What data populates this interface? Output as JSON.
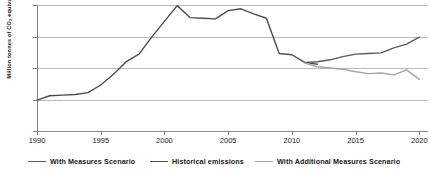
{
  "chart_data": {
    "type": "line",
    "title": "",
    "xlabel": "",
    "ylabel": "Million tonnes of CO2 equivalent",
    "ylabel_prefix": "Million tonnes of CO",
    "ylabel_sub": "2",
    "ylabel_suffix": " equivalent",
    "xlim": [
      1990,
      2020.6
    ],
    "ylim": [
      50,
      70
    ],
    "ytick_labels": [
      "70",
      "65",
      "60",
      "55",
      "50"
    ],
    "ytick_values": [
      70,
      65,
      60,
      55,
      50
    ],
    "xtick_labels": [
      "1990",
      "1995",
      "2000",
      "2005",
      "2010",
      "2015",
      "2020"
    ],
    "xtick_values": [
      1990,
      1995,
      2000,
      2005,
      2010,
      2015,
      2020
    ],
    "grid": "horizontal",
    "legend_position": "bottom",
    "colors": {
      "historical": "#4d4d4d",
      "with_measures": "#595959",
      "with_additional_measures": "#a6a6a6",
      "gridline": "#b9b9b9",
      "axis": "#808080"
    },
    "x": [
      1990,
      1991,
      1992,
      1993,
      1994,
      1995,
      1996,
      1997,
      1998,
      1999,
      2000,
      2001,
      2002,
      2003,
      2004,
      2005,
      2006,
      2007,
      2008,
      2009,
      2010,
      2011,
      2012,
      2013,
      2014,
      2015,
      2016,
      2017,
      2018,
      2019,
      2020
    ],
    "series": [
      {
        "name": "Historical emissions",
        "color": "#4d4d4d",
        "x": [
          1990,
          1991,
          1992,
          1993,
          1994,
          1995,
          1996,
          1997,
          1998,
          1999,
          2000,
          2001,
          2002,
          2003,
          2004,
          2005,
          2006,
          2007,
          2008,
          2009,
          2010,
          2011,
          2012
        ],
        "values": [
          54.9,
          55.6,
          55.7,
          55.8,
          56.1,
          57.3,
          59.0,
          61.0,
          62.2,
          64.9,
          67.4,
          69.9,
          68.0,
          67.9,
          67.8,
          69.1,
          69.4,
          68.6,
          67.9,
          62.3,
          62.1,
          60.9,
          60.6
        ]
      },
      {
        "name": "With Measures Scenario",
        "color": "#595959",
        "x": [
          2011,
          2012,
          2013,
          2014,
          2015,
          2016,
          2017,
          2018,
          2019,
          2020
        ],
        "values": [
          60.9,
          61.0,
          61.3,
          61.8,
          62.2,
          62.3,
          62.4,
          63.2,
          63.8,
          64.9
        ]
      },
      {
        "name": "With Additional Measures Scenario",
        "color": "#a6a6a6",
        "x": [
          2011,
          2012,
          2013,
          2014,
          2015,
          2016,
          2017,
          2018,
          2019,
          2020
        ],
        "values": [
          60.8,
          60.2,
          60.0,
          59.8,
          59.4,
          59.1,
          59.2,
          58.9,
          59.7,
          58.2
        ]
      }
    ],
    "legend": [
      {
        "label": "With Measures Scenario",
        "color": "#595959"
      },
      {
        "label": "Historical emissions",
        "color": "#4d4d4d"
      },
      {
        "label": "With Additional Measures Scenario",
        "color": "#a6a6a6"
      }
    ]
  }
}
